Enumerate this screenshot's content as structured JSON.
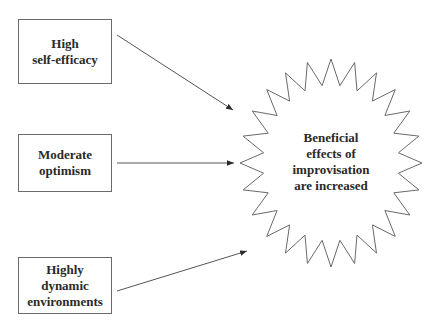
{
  "diagram": {
    "type": "concept-diagram",
    "colors": {
      "stroke": "#6a6a6a",
      "arrow": "#3a3a3a",
      "text": "#2a2a2a",
      "background": "#ffffff"
    },
    "factors": [
      {
        "id": "self-efficacy",
        "lines": [
          "High",
          "self-efficacy"
        ],
        "box": {
          "x": 18,
          "y": 19,
          "w": 94,
          "h": 65
        },
        "arrow": {
          "x1": 117,
          "y1": 35,
          "x2": 233,
          "y2": 110
        }
      },
      {
        "id": "optimism",
        "lines": [
          "Moderate",
          "optimism"
        ],
        "box": {
          "x": 18,
          "y": 134,
          "w": 94,
          "h": 58
        },
        "arrow": {
          "x1": 117,
          "y1": 163,
          "x2": 234,
          "y2": 163
        }
      },
      {
        "id": "dynamic-environments",
        "lines": [
          "Highly",
          "dynamic",
          "environments"
        ],
        "box": {
          "x": 18,
          "y": 257,
          "w": 94,
          "h": 57
        },
        "arrow": {
          "x1": 117,
          "y1": 291,
          "x2": 247,
          "y2": 251
        }
      }
    ],
    "outcome": {
      "lines": [
        "Beneficial",
        "effects of",
        "improvisation",
        "are increased"
      ],
      "star": {
        "cx": 331,
        "cy": 163,
        "points": 24,
        "outer_rx": 91,
        "outer_ry": 104,
        "inner_rx": 68,
        "inner_ry": 78
      }
    }
  }
}
